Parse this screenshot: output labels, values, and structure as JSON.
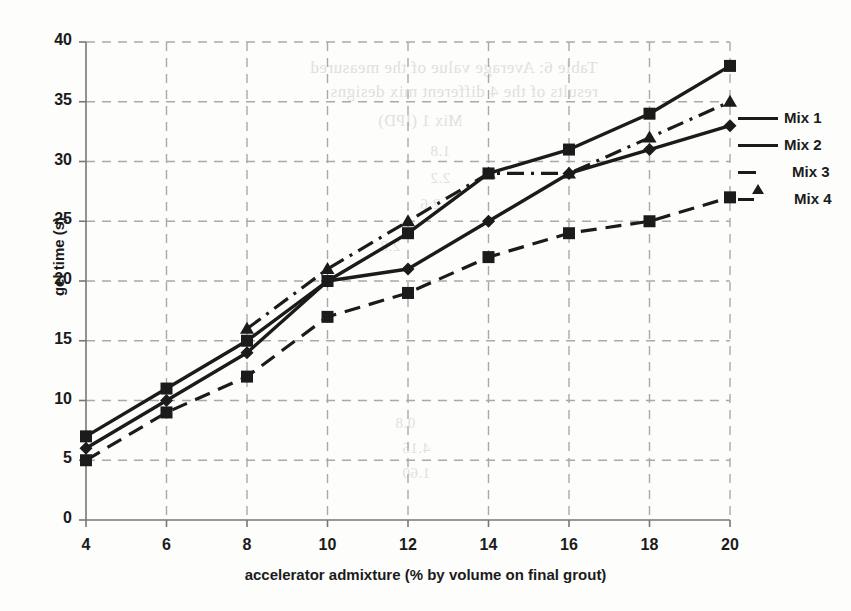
{
  "chart_data": {
    "type": "line",
    "title": "",
    "xlabel": "accelerator admixture (% by volume on final grout)",
    "ylabel": "gel time (s)",
    "x": [
      4,
      6,
      8,
      10,
      12,
      14,
      16,
      18,
      20
    ],
    "xticks": [
      "4",
      "6",
      "8",
      "10",
      "12",
      "14",
      "16",
      "18",
      "20"
    ],
    "yticks": [
      "0",
      "5",
      "10",
      "15",
      "20",
      "25",
      "30",
      "35",
      "40"
    ],
    "xlim": [
      4,
      20
    ],
    "ylim": [
      0,
      40
    ],
    "grid": true,
    "legend_position": "right",
    "series": [
      {
        "name": "Mix 1",
        "marker": "diamond",
        "linestyle": "solid",
        "values": [
          6,
          10,
          14,
          20,
          21,
          25,
          29,
          31,
          33
        ]
      },
      {
        "name": "Mix 2",
        "marker": "square",
        "linestyle": "solid",
        "values": [
          7,
          11,
          15,
          20,
          24,
          29,
          31,
          34,
          38
        ]
      },
      {
        "name": "Mix 3",
        "marker": "triangle",
        "linestyle": "dash-dot",
        "values": [
          null,
          null,
          16,
          21,
          25,
          29,
          29,
          32,
          35
        ]
      },
      {
        "name": "Mix 4",
        "marker": "square",
        "linestyle": "dashed",
        "values": [
          5,
          9,
          12,
          17,
          19,
          22,
          24,
          25,
          27
        ]
      }
    ]
  },
  "legend": {
    "items": [
      {
        "label": "Mix 1"
      },
      {
        "label": "Mix 2"
      },
      {
        "label": "Mix 3"
      },
      {
        "label": "Mix 4"
      }
    ]
  },
  "background_text": {
    "line1": "Table 6: Average value of the measured",
    "line2": "results of the 4 different mix designs",
    "line3": "Mix 1 (IPD)",
    "line4": "1.8",
    "line5": "2.2",
    "line6": "2.6",
    "line7": "2.8",
    "line8": "0.8",
    "line9": "4.15",
    "line10": "1.60"
  }
}
